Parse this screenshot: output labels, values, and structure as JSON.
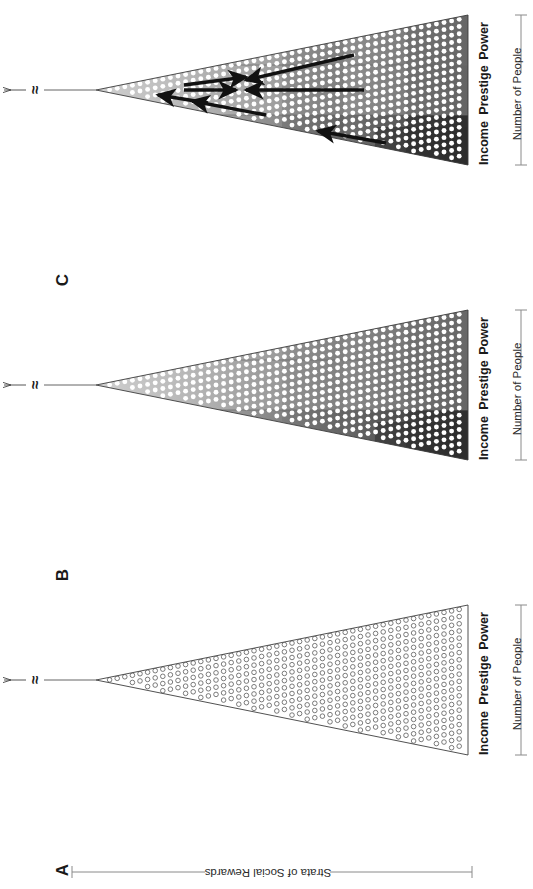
{
  "figure": {
    "type": "stratification-pyramid-diagram",
    "orientation_deg": 90,
    "axis_vertical_label": "Strata of Social Rewards",
    "axis_horizontal_label": "Number of People",
    "apex_break_symbol": "≈",
    "panels": [
      {
        "letter": "A",
        "style": "outline",
        "description": "open-circle triangle, no shading",
        "band_labels": [
          "Income",
          "Prestige",
          "Power"
        ],
        "arrows": []
      },
      {
        "letter": "B",
        "style": "graded",
        "description": "shaded triangle with stepped gray gradient, no mobility arrows",
        "band_labels": [
          "Income",
          "Prestige",
          "Power"
        ],
        "arrows": []
      },
      {
        "letter": "C",
        "style": "graded-with-arrows",
        "description": "shaded triangle with social-mobility arrows",
        "band_labels": [
          "Income",
          "Prestige",
          "Power"
        ],
        "arrows": [
          {
            "id": "up-1",
            "direction": "toward-apex"
          },
          {
            "id": "up-2",
            "direction": "toward-apex"
          },
          {
            "id": "down-1",
            "direction": "toward-base"
          },
          {
            "id": "down-2",
            "direction": "toward-base"
          },
          {
            "id": "down-3",
            "direction": "toward-base"
          },
          {
            "id": "down-4",
            "direction": "toward-base"
          },
          {
            "id": "down-5",
            "direction": "toward-base"
          }
        ]
      }
    ],
    "band_labels": [
      "Income",
      "Prestige",
      "Power"
    ],
    "colors": {
      "ink": "#1a1a1a",
      "outline": "#555555",
      "dot": "#ffffff",
      "dot_outline": "#555555",
      "axis": "#8a8a8a",
      "shade_light": "#b9b9b9",
      "shade_mid": "#8e8e8e",
      "shade_dark": "#3a3a3a",
      "background": "#ffffff"
    }
  },
  "chart_data": {
    "type": "diagram",
    "xlabel": "Number of People",
    "ylabel": "Strata of Social Rewards",
    "categories": [
      "Income",
      "Prestige",
      "Power"
    ],
    "panels": [
      "A",
      "B",
      "C"
    ],
    "series": [
      {
        "name": "A",
        "values": [
          1,
          1,
          1
        ],
        "note": "unshaded distribution"
      },
      {
        "name": "B",
        "values": [
          1,
          1,
          1
        ],
        "note": "reward-graded distribution"
      },
      {
        "name": "C",
        "values": [
          1,
          1,
          1
        ],
        "note": "graded distribution with mobility"
      }
    ],
    "legend": [],
    "grid": false
  }
}
